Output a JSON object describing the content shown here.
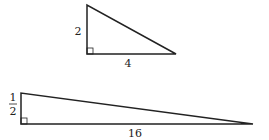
{
  "diagram": {
    "triangles": [
      {
        "name": "small-right-triangle",
        "vertical_leg_label": "2",
        "horizontal_leg_label": "4",
        "right_angle": true
      },
      {
        "name": "long-right-triangle",
        "vertical_leg_label_numerator": "1",
        "vertical_leg_label_denominator": "2",
        "horizontal_leg_label": "16",
        "right_angle": true
      }
    ],
    "stroke_color": "#222222",
    "background": "#ffffff"
  }
}
